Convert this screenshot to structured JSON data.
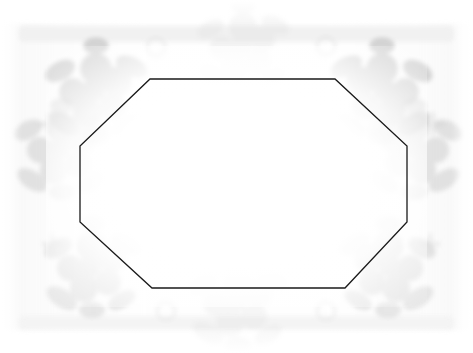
{
  "document": {
    "kind": "scanned-blank-certificate",
    "title": "",
    "body_text": "",
    "caption": "",
    "page_background_color": "#ffffff",
    "canvas": {
      "width": 473,
      "height": 353
    }
  },
  "frame": {
    "name": "octagonal-border",
    "shape": "octagon",
    "stroke_color": "#1a1a1a",
    "stroke_width": 1.3,
    "fill": "none",
    "vertices": [
      {
        "x": 150,
        "y": 79
      },
      {
        "x": 335,
        "y": 79
      },
      {
        "x": 407,
        "y": 146
      },
      {
        "x": 407,
        "y": 222
      },
      {
        "x": 345,
        "y": 288
      },
      {
        "x": 152,
        "y": 288
      },
      {
        "x": 80,
        "y": 222
      },
      {
        "x": 80,
        "y": 146
      }
    ],
    "edges": [
      {
        "name": "top-edge",
        "y": 79,
        "x_from": 150,
        "x_to": 335
      },
      {
        "name": "top-right-diagonal",
        "from": [
          335,
          79
        ],
        "to": [
          407,
          146
        ]
      },
      {
        "name": "right-edge",
        "x": 407,
        "y_from": 146,
        "y_to": 222
      },
      {
        "name": "bottom-right-diagonal",
        "from": [
          407,
          222
        ],
        "to": [
          345,
          288
        ]
      },
      {
        "name": "bottom-edge",
        "y": 288,
        "x_from": 152,
        "x_to": 345
      },
      {
        "name": "bottom-left-diagonal",
        "from": [
          152,
          288
        ],
        "to": [
          80,
          222
        ]
      },
      {
        "name": "left-edge",
        "x": 80,
        "y_from": 146,
        "y_to": 222
      },
      {
        "name": "top-left-diagonal",
        "from": [
          80,
          146
        ],
        "to": [
          150,
          79
        ]
      }
    ]
  },
  "ornament": {
    "name": "floral-border-ornament",
    "description": "faded blurred floral and leaf motifs framing the octagon",
    "ink_color": "#b9b9b9",
    "ink_color_light": "#d8d8d8",
    "ink_color_faint": "#ededed",
    "band": {
      "top": 24,
      "bottom": 330
    },
    "clusters": [
      {
        "name": "flower-cluster-top-left",
        "cx": 96,
        "cy": 92,
        "scale": 1.05,
        "opacity": 0.55
      },
      {
        "name": "flower-cluster-left",
        "cx": 62,
        "cy": 150,
        "scale": 1.0,
        "opacity": 0.45
      },
      {
        "name": "flower-cluster-bottom-left",
        "cx": 92,
        "cy": 268,
        "scale": 1.0,
        "opacity": 0.42
      },
      {
        "name": "flower-cluster-top-right",
        "cx": 382,
        "cy": 92,
        "scale": 1.05,
        "opacity": 0.55
      },
      {
        "name": "flower-cluster-right",
        "cx": 414,
        "cy": 150,
        "scale": 1.0,
        "opacity": 0.45
      },
      {
        "name": "flower-cluster-bottom-right",
        "cx": 388,
        "cy": 268,
        "scale": 1.0,
        "opacity": 0.42
      },
      {
        "name": "flower-cluster-top-center",
        "cx": 243,
        "cy": 48,
        "scale": 0.95,
        "opacity": 0.3
      },
      {
        "name": "flower-cluster-bottom-center",
        "cx": 238,
        "cy": 303,
        "scale": 1.0,
        "opacity": 0.28
      }
    ],
    "rings": [
      {
        "name": "ring-motif-top-left",
        "cx": 156,
        "cy": 47,
        "r": 9,
        "opacity": 0.3
      },
      {
        "name": "ring-motif-top-right",
        "cx": 326,
        "cy": 46,
        "r": 9,
        "opacity": 0.3
      },
      {
        "name": "ring-motif-bottom-left",
        "cx": 166,
        "cy": 311,
        "r": 9,
        "opacity": 0.26
      },
      {
        "name": "ring-motif-bottom-right",
        "cx": 326,
        "cy": 311,
        "r": 9,
        "opacity": 0.26
      }
    ],
    "sparkles": [
      {
        "name": "sparkle-left",
        "cx": 50,
        "cy": 124,
        "size": 9,
        "opacity": 0.34
      },
      {
        "name": "sparkle-right",
        "cx": 433,
        "cy": 124,
        "size": 9,
        "opacity": 0.34
      },
      {
        "name": "sparkle-lower-left",
        "cx": 52,
        "cy": 244,
        "size": 8,
        "opacity": 0.28
      },
      {
        "name": "sparkle-lower-right",
        "cx": 430,
        "cy": 244,
        "size": 8,
        "opacity": 0.28
      }
    ]
  }
}
